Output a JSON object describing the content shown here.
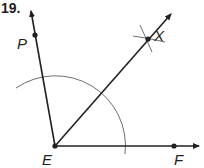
{
  "problem": {
    "number": "19."
  },
  "points": {
    "P": {
      "label": "P",
      "x": 35,
      "y": 35
    },
    "X": {
      "label": "X",
      "x": 148,
      "y": 39
    },
    "E": {
      "label": "E",
      "x": 55,
      "y": 146
    },
    "F": {
      "label": "F",
      "x": 174,
      "y": 146
    }
  },
  "rays": [
    {
      "name": "ray-EP",
      "from": "E",
      "through": "P"
    },
    {
      "name": "ray-EX",
      "from": "E",
      "through": "X"
    },
    {
      "name": "ray-EF",
      "from": "E",
      "through": "F"
    }
  ],
  "construction": {
    "arc": "arc centered at E intersecting rays EP and EF",
    "intersecting_arcs_at": "X",
    "result": "EX bisects angle PEF"
  },
  "colors": {
    "ink": "#231f20",
    "construction": "#6d6e71"
  }
}
